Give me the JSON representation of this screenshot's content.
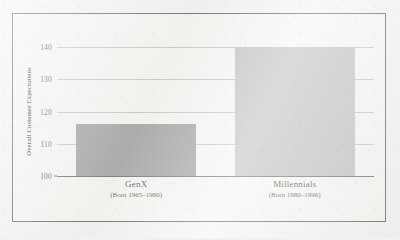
{
  "chart_data": {
    "type": "bar",
    "title": "",
    "subtitle": "",
    "xlabel": "",
    "ylabel": "Overall Customer Expectations",
    "categories": [
      "GenX",
      "Millennials"
    ],
    "category_sublabels": [
      "(Born 1965–1980)",
      "(Born 1980–1996)"
    ],
    "values": [
      116,
      140
    ],
    "ylim": [
      100,
      140
    ],
    "yticks": [
      100,
      110,
      120,
      130,
      140
    ],
    "ytick_labels": [
      "100",
      "110",
      "120",
      "130",
      "140"
    ],
    "grid": true,
    "legend": "none",
    "bar_colors": [
      "#8a8a8a",
      "#b1b1b1"
    ],
    "bars": [
      {
        "label": "GenX",
        "sublabel": "(Born 1965–1980)",
        "value": 116,
        "color": "#8a8a8a"
      },
      {
        "label": "Millennials",
        "sublabel": "(Born 1980–1996)",
        "value": 140,
        "color": "#b1b1b1"
      }
    ]
  },
  "style": {
    "frame_color": "#3c3b3a",
    "gridline_color": "#b9b7b4",
    "axis_color": "#4a4948",
    "page_background": "#f2f1ef"
  }
}
